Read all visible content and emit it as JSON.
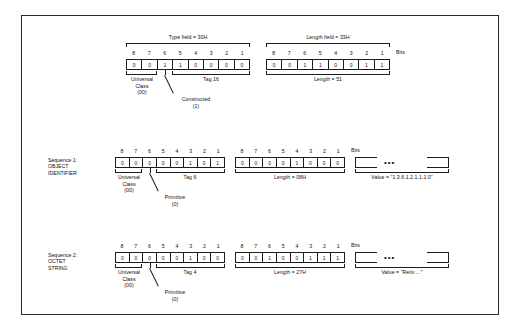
{
  "diagram": {
    "bit_numbers": [
      "8",
      "7",
      "6",
      "5",
      "4",
      "3",
      "2",
      "1"
    ],
    "bits_label": "Bits",
    "dots": "•••"
  },
  "header_row": {
    "type_field": {
      "caption": "Type field = 30H",
      "bits": [
        "0",
        "0",
        "1",
        "1",
        "0",
        "0",
        "0",
        "0"
      ],
      "class_label_lines": [
        "Universal",
        "Class",
        "(00)"
      ],
      "form_label_lines": [
        "Constructed",
        "(1)"
      ],
      "tag_label": "Tag 16"
    },
    "length_field": {
      "caption": "Length field = 33H",
      "bits": [
        "0",
        "0",
        "1",
        "1",
        "0",
        "0",
        "1",
        "1"
      ],
      "length_label": "Length = 51"
    }
  },
  "sequence1": {
    "row_label_lines": [
      "Sequence 1:",
      "OBJECT",
      "IDENTIFIER"
    ],
    "type_field": {
      "bits": [
        "0",
        "0",
        "0",
        "0",
        "0",
        "1",
        "0",
        "1"
      ],
      "class_label_lines": [
        "Universal",
        "Class",
        "(00)"
      ],
      "form_label_lines": [
        "Primitive",
        "(0)"
      ],
      "tag_label": "Tag 6"
    },
    "length_field": {
      "bits": [
        "0",
        "0",
        "0",
        "0",
        "1",
        "0",
        "0",
        "0"
      ],
      "length_label": "Length = 08H"
    },
    "value_field": {
      "value_label": "Value = \"1.3.6.1.2.1.1.1.0\""
    }
  },
  "sequence2": {
    "row_label_lines": [
      "Sequence 2:",
      "OCTET",
      "STRING"
    ],
    "type_field": {
      "bits": [
        "0",
        "0",
        "0",
        "0",
        "0",
        "1",
        "0",
        "0"
      ],
      "class_label_lines": [
        "Universal",
        "Class",
        "(00)"
      ],
      "form_label_lines": [
        "Primitive",
        "(0)"
      ],
      "tag_label": "Tag 4"
    },
    "length_field": {
      "bits": [
        "0",
        "0",
        "1",
        "0",
        "0",
        "1",
        "1",
        "1"
      ],
      "length_label": "Length = 27H"
    },
    "value_field": {
      "value_label": "Value = \"Retix ...\""
    }
  },
  "colors": {
    "ink": "#1d1d1d",
    "background": "#ffffff"
  }
}
